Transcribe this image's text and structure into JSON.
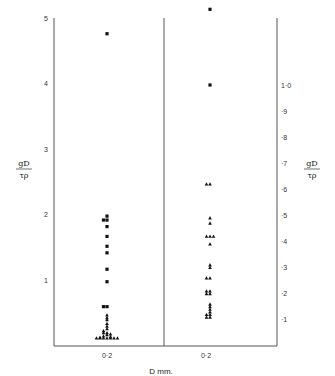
{
  "chart_data": {
    "type": "scatter",
    "title": "",
    "xlabel": "D mm.",
    "panels": [
      {
        "name": "left",
        "ylabel": "gD / τρ",
        "ylim": [
          0,
          5
        ],
        "yticks": [
          "1",
          "2",
          "3",
          "4",
          "5"
        ],
        "xtick": "0·2",
        "series": [
          {
            "name": "squares",
            "marker": "square",
            "x": [
              0.2,
              0.2,
              0.2,
              0.2,
              0.2,
              0.2,
              0.2,
              0.2,
              0.2,
              0.2,
              0.2,
              0.2
            ],
            "y": [
              4.76,
              1.98,
              1.92,
              1.92,
              1.82,
              1.67,
              1.52,
              1.42,
              1.17,
              0.98,
              0.6,
              0.6
            ]
          },
          {
            "name": "triangles",
            "marker": "triangle",
            "x": [
              0.2,
              0.2,
              0.2,
              0.2,
              0.2,
              0.2,
              0.2,
              0.2,
              0.2,
              0.2,
              0.2,
              0.2,
              0.2,
              0.2,
              0.2,
              0.2,
              0.2,
              0.2,
              0.2,
              0.2,
              0.2
            ],
            "y": [
              0.47,
              0.43,
              0.4,
              0.34,
              0.3,
              0.26,
              0.23,
              0.2,
              0.2,
              0.18,
              0.17,
              0.15,
              0.14,
              0.13,
              0.12,
              0.12,
              0.12,
              0.12,
              0.12,
              0.12,
              0.12
            ]
          }
        ]
      },
      {
        "name": "right",
        "ylabel": "gD / τρ",
        "ylim": [
          0,
          1.33
        ],
        "yticks": [
          "·1",
          "·2",
          "·3",
          "·4",
          "·5",
          "·6",
          "·7",
          "·8",
          "·9",
          "1·0"
        ],
        "xtick": "0·2",
        "series": [
          {
            "name": "squares",
            "marker": "square",
            "x": [
              0.2,
              0.2
            ],
            "y": [
              1.29,
              1.0
            ]
          },
          {
            "name": "triangles",
            "marker": "triangle",
            "x": [
              0.2,
              0.2,
              0.2,
              0.2,
              0.2,
              0.2,
              0.2,
              0.2,
              0.2,
              0.2,
              0.2,
              0.2,
              0.2,
              0.2,
              0.2,
              0.2,
              0.2,
              0.2,
              0.2,
              0.2,
              0.2,
              0.2,
              0.2,
              0.2
            ],
            "y": [
              0.62,
              0.62,
              0.49,
              0.47,
              0.42,
              0.42,
              0.42,
              0.39,
              0.31,
              0.3,
              0.26,
              0.26,
              0.21,
              0.21,
              0.2,
              0.2,
              0.16,
              0.15,
              0.14,
              0.13,
              0.12,
              0.12,
              0.11,
              0.11
            ]
          }
        ]
      }
    ]
  },
  "labels": {
    "xlabel": "D mm.",
    "left_xtick": "0·2",
    "right_xtick": "0·2",
    "ylabel_num": "gD",
    "ylabel_den": "τρ"
  }
}
